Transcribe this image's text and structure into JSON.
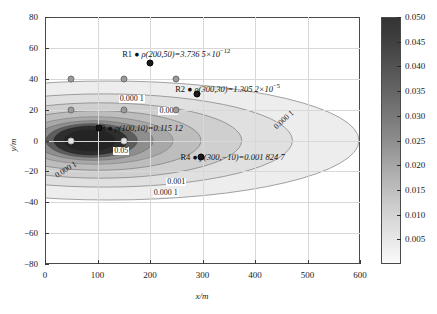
{
  "chart_data": {
    "type": "heatmap",
    "title": "",
    "xlabel": "x/m",
    "ylabel": "y/m",
    "xlim": [
      0,
      600
    ],
    "ylim": [
      -80,
      80
    ],
    "xticks": [
      "0",
      "100",
      "200",
      "300",
      "400",
      "500",
      "600"
    ],
    "xtick_values": [
      0,
      100,
      200,
      300,
      400,
      500,
      600
    ],
    "yticks": [
      "80",
      "60",
      "40",
      "20",
      "0",
      "-20",
      "-40",
      "-60",
      "-80"
    ],
    "ytick_values": [
      80,
      60,
      40,
      20,
      0,
      -20,
      -40,
      -60,
      -80
    ],
    "grid": true,
    "colorbar": {
      "ticks": [
        "0.050",
        "0.045",
        "0.040",
        "0.035",
        "0.030",
        "0.025",
        "0.020",
        "0.015",
        "0.010",
        "0.005"
      ],
      "tick_values": [
        0.05,
        0.045,
        0.04,
        0.035,
        0.03,
        0.025,
        0.02,
        0.015,
        0.01,
        0.005
      ],
      "vmin": 0.0,
      "vmax": 0.05,
      "position": "right"
    },
    "contour_levels": [
      0.0001,
      0.001,
      0.05
    ],
    "contour_labels": [
      {
        "text": "0.000 1",
        "x": 165,
        "y": 27,
        "rotation": 0
      },
      {
        "text": "0.001",
        "x": 235,
        "y": 19,
        "rotation": 0
      },
      {
        "text": "0.05",
        "x": 145,
        "y": -7,
        "rotation": 0
      },
      {
        "text": "0.000 1",
        "x": 455,
        "y": 13,
        "rotation": -42
      },
      {
        "text": "0.000 1",
        "x": 40,
        "y": -19,
        "rotation": -32
      },
      {
        "text": "0.001",
        "x": 250,
        "y": -27,
        "rotation": 0
      },
      {
        "text": "0.000 1",
        "x": 230,
        "y": -34,
        "rotation": 0
      }
    ],
    "markers": [
      {
        "x": 50,
        "y": 40,
        "style": "grey"
      },
      {
        "x": 150,
        "y": 40,
        "style": "grey"
      },
      {
        "x": 250,
        "y": 40,
        "style": "grey"
      },
      {
        "x": 50,
        "y": 20,
        "style": "grey"
      },
      {
        "x": 150,
        "y": 20,
        "style": "grey"
      },
      {
        "x": 250,
        "y": 20,
        "style": "grey"
      },
      {
        "x": 50,
        "y": 0,
        "style": "light"
      },
      {
        "x": 150,
        "y": 0,
        "style": "light"
      }
    ],
    "annotations": [
      {
        "id": "R1",
        "point": [
          200,
          50
        ],
        "marker_x": 200,
        "marker_y": 50,
        "label_x": 147,
        "label_y": 57,
        "expr": "ρ(200,50)=3.736 5×10",
        "exp": "−12"
      },
      {
        "id": "R2",
        "point": [
          300,
          30
        ],
        "marker_x": 290,
        "marker_y": 30,
        "label_x": 248,
        "label_y": 34,
        "expr": "ρ(300,30)=1.305 2×10",
        "exp": "−5"
      },
      {
        "id": "R3",
        "point": [
          100,
          10
        ],
        "marker_x": 103,
        "marker_y": 8,
        "label_x": 96,
        "label_y": 8,
        "expr": "ρ(100,10)=0.115 12",
        "exp": ""
      },
      {
        "id": "R4",
        "point": [
          300,
          -10
        ],
        "marker_x": 298,
        "marker_y": -11,
        "label_x": 258,
        "label_y": -11,
        "expr": "ρ(300,−10)=0.001 824 7",
        "exp": ""
      }
    ],
    "field_description": "Nested elliptical contours of density rho centered near x=120, y=0, decaying outward toward the plot edges."
  },
  "colors": {
    "frame": "#4a4a4a",
    "grid": "#d8d8d8",
    "band_outer": "#ededed",
    "band_mid": "#cfcfcf",
    "band_inner": "#a8a8a8",
    "band_core": "#2e2e2e",
    "marker_grey": "#9a9a9a",
    "marker_dark": "#1a1a1a",
    "text": "#1a1a1a"
  }
}
